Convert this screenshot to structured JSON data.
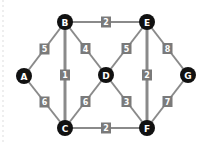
{
  "diagram": {
    "type": "weighted-undirected-graph",
    "nodes": [
      {
        "id": "A",
        "label": "A",
        "x": 24,
        "y": 76
      },
      {
        "id": "B",
        "label": "B",
        "x": 65,
        "y": 22
      },
      {
        "id": "C",
        "label": "C",
        "x": 65,
        "y": 128
      },
      {
        "id": "D",
        "label": "D",
        "x": 106,
        "y": 75
      },
      {
        "id": "E",
        "label": "E",
        "x": 147,
        "y": 22
      },
      {
        "id": "F",
        "label": "F",
        "x": 147,
        "y": 128
      },
      {
        "id": "G",
        "label": "G",
        "x": 188,
        "y": 75
      }
    ],
    "edges": [
      {
        "from": "A",
        "to": "B",
        "weight": "5",
        "thick": false
      },
      {
        "from": "A",
        "to": "C",
        "weight": "6",
        "thick": false
      },
      {
        "from": "B",
        "to": "C",
        "weight": "1",
        "thick": true
      },
      {
        "from": "B",
        "to": "D",
        "weight": "4",
        "thick": false
      },
      {
        "from": "B",
        "to": "E",
        "weight": "2",
        "thick": false
      },
      {
        "from": "C",
        "to": "D",
        "weight": "6",
        "thick": false
      },
      {
        "from": "C",
        "to": "F",
        "weight": "2",
        "thick": false
      },
      {
        "from": "D",
        "to": "E",
        "weight": "5",
        "thick": false
      },
      {
        "from": "D",
        "to": "F",
        "weight": "3",
        "thick": false
      },
      {
        "from": "E",
        "to": "F",
        "weight": "2",
        "thick": true
      },
      {
        "from": "E",
        "to": "G",
        "weight": "8",
        "thick": false
      },
      {
        "from": "F",
        "to": "G",
        "weight": "7",
        "thick": false
      }
    ],
    "colors": {
      "node_fill": "#111111",
      "node_text": "#ffffff",
      "edge": "#8a8a8a",
      "label_box": "#7a7a7a",
      "label_text": "#ffffff"
    }
  }
}
